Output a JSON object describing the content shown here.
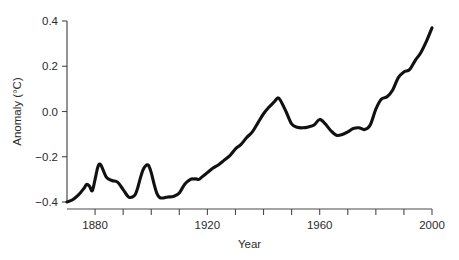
{
  "chart_data": {
    "type": "line",
    "title": "",
    "xlabel": "Year",
    "ylabel": "Anomaly (°C)",
    "xlim": [
      1870,
      2000
    ],
    "ylim": [
      -0.4,
      0.4
    ],
    "grid": false,
    "legend": "none",
    "x_major_ticks": [
      1880,
      1920,
      1960,
      2000
    ],
    "x_major_tick_labels": [
      "1880",
      "1920",
      "1960",
      "2000"
    ],
    "x_minor_ticks": [
      1890,
      1900,
      1910,
      1930,
      1940,
      1950,
      1970,
      1980,
      1990
    ],
    "y_ticks": [
      -0.4,
      -0.2,
      0.0,
      0.2,
      0.4
    ],
    "y_tick_labels": [
      "−0.4",
      "−0.2",
      "0.0",
      "0.2",
      "0.4"
    ],
    "line_color": "#111111",
    "axis_color": "#4a4a4a",
    "series": [
      {
        "name": "Global temperature anomaly",
        "x": [
          1870,
          1872,
          1874,
          1876,
          1877,
          1878,
          1879,
          1880,
          1881,
          1882,
          1884,
          1886,
          1888,
          1890,
          1892,
          1894,
          1895,
          1896,
          1897,
          1898,
          1899,
          1900,
          1901,
          1902,
          1903,
          1904,
          1905,
          1906,
          1908,
          1910,
          1912,
          1914,
          1915,
          1916,
          1917,
          1918,
          1920,
          1922,
          1924,
          1926,
          1928,
          1930,
          1932,
          1934,
          1936,
          1938,
          1940,
          1942,
          1944,
          1945,
          1946,
          1948,
          1950,
          1952,
          1954,
          1956,
          1958,
          1960,
          1962,
          1964,
          1966,
          1968,
          1970,
          1972,
          1974,
          1976,
          1978,
          1980,
          1982,
          1984,
          1986,
          1988,
          1990,
          1992,
          1994,
          1996,
          1998,
          2000
        ],
        "y": [
          -0.4,
          -0.39,
          -0.37,
          -0.34,
          -0.322,
          -0.33,
          -0.35,
          -0.3,
          -0.245,
          -0.235,
          -0.29,
          -0.305,
          -0.312,
          -0.345,
          -0.378,
          -0.372,
          -0.345,
          -0.3,
          -0.26,
          -0.24,
          -0.238,
          -0.27,
          -0.32,
          -0.362,
          -0.38,
          -0.382,
          -0.38,
          -0.378,
          -0.375,
          -0.36,
          -0.32,
          -0.3,
          -0.298,
          -0.298,
          -0.3,
          -0.29,
          -0.27,
          -0.25,
          -0.235,
          -0.215,
          -0.195,
          -0.165,
          -0.145,
          -0.115,
          -0.09,
          -0.05,
          -0.01,
          0.02,
          0.045,
          0.06,
          0.05,
          0.0,
          -0.055,
          -0.07,
          -0.072,
          -0.068,
          -0.06,
          -0.035,
          -0.055,
          -0.085,
          -0.105,
          -0.102,
          -0.09,
          -0.075,
          -0.072,
          -0.08,
          -0.06,
          0.01,
          0.055,
          0.065,
          0.095,
          0.15,
          0.175,
          0.185,
          0.225,
          0.26,
          0.31,
          0.37
        ]
      }
    ]
  },
  "axes": {
    "y_label": "Anomaly (°C)",
    "x_label": "Year"
  }
}
